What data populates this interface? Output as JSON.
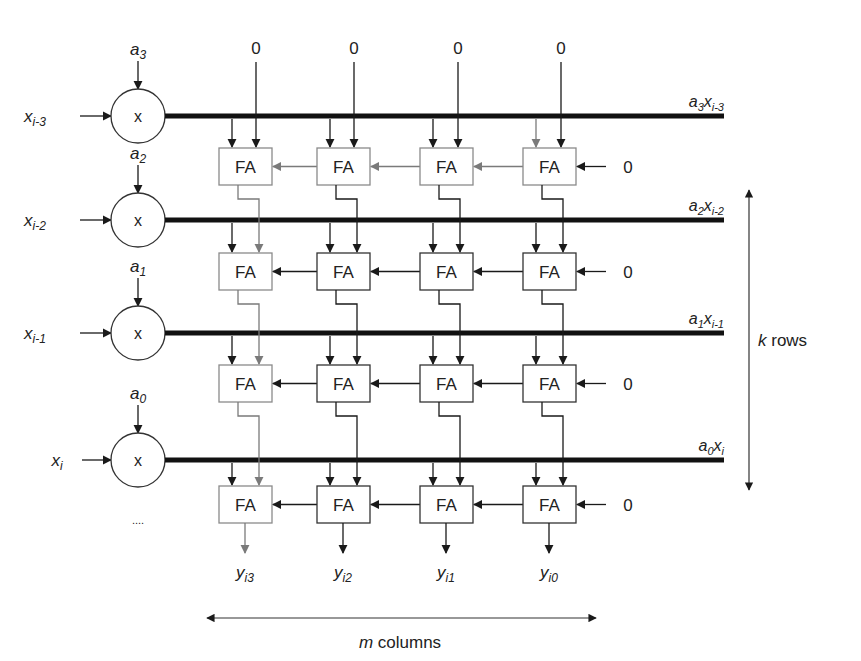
{
  "diagram": {
    "colors": {
      "black": "#1a1a1a",
      "gray": "#7a7a7a",
      "bus": "#111111",
      "text": "#222222"
    },
    "top_inputs": [
      {
        "label": "0",
        "x": 256
      },
      {
        "label": "0",
        "x": 354
      },
      {
        "label": "0",
        "x": 458
      },
      {
        "label": "0",
        "x": 561
      }
    ],
    "rows": [
      {
        "coef": {
          "base": "a",
          "sub": "3"
        },
        "input": {
          "base": "x",
          "sub": "i-3"
        },
        "product": {
          "base1": "a",
          "sub1": "3",
          "base2": "x",
          "sub2": "i-3"
        },
        "bus_y": 116,
        "fa_y": 148,
        "carry_in": "0",
        "multiplier_symbol": "x",
        "faded_box_cols": [
          0,
          1,
          2,
          3
        ],
        "fa_label": "FA"
      },
      {
        "coef": {
          "base": "a",
          "sub": "2"
        },
        "input": {
          "base": "x",
          "sub": "i-2"
        },
        "product": {
          "base1": "a",
          "sub1": "2",
          "base2": "x",
          "sub2": "i-2"
        },
        "bus_y": 220,
        "fa_y": 253,
        "carry_in": "0",
        "multiplier_symbol": "x",
        "faded_box_cols": [
          0
        ],
        "fa_label": "FA"
      },
      {
        "coef": {
          "base": "a",
          "sub": "1"
        },
        "input": {
          "base": "x",
          "sub": "i-1"
        },
        "product": {
          "base1": "a",
          "sub1": "1",
          "base2": "x",
          "sub2": "i-1"
        },
        "bus_y": 333,
        "fa_y": 365,
        "carry_in": "0",
        "multiplier_symbol": "x",
        "faded_box_cols": [
          0
        ],
        "fa_label": "FA"
      },
      {
        "coef": {
          "base": "a",
          "sub": "0"
        },
        "input": {
          "base": "x",
          "sub": "i"
        },
        "product": {
          "base1": "a",
          "sub1": "0",
          "base2": "x",
          "sub2": "i"
        },
        "bus_y": 460,
        "fa_y": 486,
        "carry_in": "0",
        "multiplier_symbol": "x",
        "faded_box_cols": [
          0
        ],
        "fa_label": "FA"
      }
    ],
    "columns_x": [
      219,
      317,
      420,
      523
    ],
    "fa_box": {
      "w": 53,
      "h": 37
    },
    "outputs": [
      {
        "base": "y",
        "sub": "i3"
      },
      {
        "base": "y",
        "sub": "i2"
      },
      {
        "base": "y",
        "sub": "i1"
      },
      {
        "base": "y",
        "sub": "i0"
      }
    ],
    "ellipsis": "....",
    "k_rows_label": {
      "var": "k",
      "text": " rows"
    },
    "m_columns_label": {
      "var": "m",
      "text": " columns"
    }
  }
}
